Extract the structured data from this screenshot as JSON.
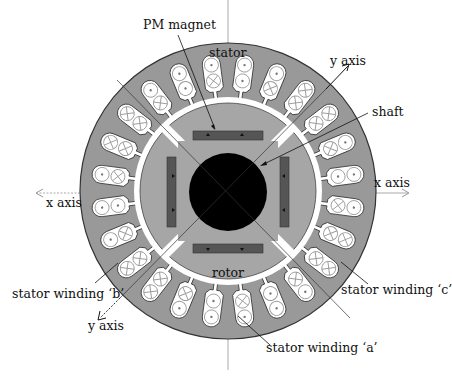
{
  "diagram": {
    "center": {
      "x": 228,
      "y": 191
    },
    "colors": {
      "stator": "#999999",
      "rotor": "#a6a6a6",
      "magnet": "#555555",
      "shaft": "#000000",
      "slot_fill": "#ffffff",
      "conductor_stroke": "#9a9a9a",
      "outline": "#333333",
      "axis_line": "#aaaaaa"
    },
    "slot_count": 24,
    "slots": [
      [
        "dot",
        "dot"
      ],
      [
        "dot",
        "cross"
      ],
      [
        "cross",
        "cross"
      ],
      [
        "cross",
        "cross"
      ],
      [
        "dot",
        "cross"
      ],
      [
        "dot",
        "dot"
      ],
      [
        "dot",
        "cross"
      ],
      [
        "cross",
        "cross"
      ],
      [
        "cross",
        "cross"
      ],
      [
        "dot",
        "cross"
      ],
      [
        "dot",
        "dot"
      ],
      [
        "dot",
        "cross"
      ],
      [
        "dot",
        "dot"
      ],
      [
        "dot",
        "cross"
      ],
      [
        "cross",
        "cross"
      ],
      [
        "cross",
        "cross"
      ],
      [
        "dot",
        "cross"
      ],
      [
        "dot",
        "dot"
      ],
      [
        "dot",
        "cross"
      ],
      [
        "cross",
        "cross"
      ],
      [
        "cross",
        "cross"
      ],
      [
        "dot",
        "cross"
      ],
      [
        "dot",
        "dot"
      ],
      [
        "dot",
        "cross"
      ]
    ],
    "labels": {
      "pm_magnet": "PM magnet",
      "stator": "stator",
      "y_axis_top": "y axis",
      "shaft": "shaft",
      "x_axis_right": "x axis",
      "x_axis_left": "x axis",
      "rotor": "rotor",
      "winding_b": "stator winding ‘b’",
      "winding_c": "stator winding ‘c’",
      "winding_a": "stator winding ‘a’",
      "y_axis_bottom": "y axis"
    }
  }
}
